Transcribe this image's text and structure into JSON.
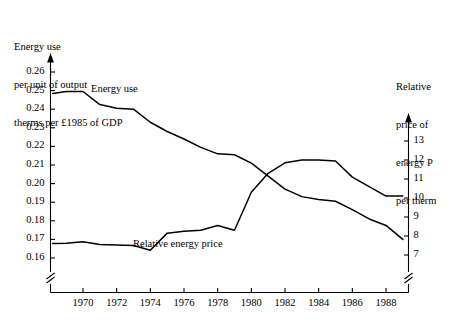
{
  "figure": {
    "left_caption_lines": [
      "Energy use",
      "per unit of output",
      "therms per £1985 of GDP"
    ],
    "right_caption_lines": [
      "Relative",
      "price of",
      "energy P",
      "per therm"
    ]
  },
  "chart_data": {
    "type": "line",
    "title": "",
    "xlabel": "",
    "ylabel": "Energy use per unit of output therms per £1985 of GDP",
    "y2label": "Relative price of energy P per therm",
    "grid": false,
    "legend": "inline-labels",
    "xlim": [
      1968.2,
      1989.2
    ],
    "xticks": [
      1970,
      1972,
      1974,
      1976,
      1978,
      1980,
      1982,
      1984,
      1986,
      1988
    ],
    "xticklabels": [
      "1970",
      "1972",
      "1974",
      "1976",
      "1978",
      "1980",
      "1982",
      "1984",
      "1986",
      "1988"
    ],
    "ylim": [
      0.155,
      0.265
    ],
    "yticks": [
      0.16,
      0.17,
      0.18,
      0.19,
      0.2,
      0.21,
      0.22,
      0.23,
      0.24,
      0.25,
      0.26
    ],
    "yticklabels": [
      "0.16",
      "0.17",
      "0.18",
      "0.19",
      "0.20",
      "0.21",
      "0.22",
      "0.23",
      "0.24",
      "0.25",
      "0.26"
    ],
    "y2lim": [
      6.6,
      13.6
    ],
    "y2ticks": [
      7,
      8,
      9,
      10,
      11,
      12,
      13
    ],
    "y2ticklabels": [
      "7",
      "8",
      "9",
      "10",
      "11",
      "12",
      "13"
    ],
    "axis_break_left": true,
    "axis_break_right": true,
    "series": [
      {
        "name": "Energy use",
        "axis": "left",
        "label_text": "Energy use",
        "x": [
          1968.2,
          1969,
          1970,
          1971,
          1972,
          1973,
          1974,
          1975,
          1976,
          1977,
          1978,
          1979,
          1980,
          1981,
          1982,
          1983,
          1984,
          1985,
          1986,
          1987,
          1988,
          1989
        ],
        "y": [
          0.2485,
          0.2495,
          0.2495,
          0.2425,
          0.2405,
          0.24,
          0.233,
          0.228,
          0.224,
          0.2195,
          0.216,
          0.2155,
          0.211,
          0.204,
          0.197,
          0.193,
          0.1915,
          0.1905,
          0.186,
          0.181,
          0.1775,
          0.17
        ]
      },
      {
        "name": "Relative energy price",
        "axis": "right",
        "label_text": "Relative energy price",
        "x": [
          1968.2,
          1969,
          1970,
          1971,
          1972,
          1973,
          1974,
          1975,
          1976,
          1977,
          1978,
          1979,
          1980,
          1981,
          1982,
          1983,
          1984,
          1985,
          1986,
          1987,
          1988,
          1989
        ],
        "y": [
          7.6,
          7.62,
          7.7,
          7.55,
          7.52,
          7.5,
          7.25,
          8.15,
          8.25,
          8.3,
          8.55,
          8.3,
          10.3,
          11.3,
          11.85,
          12.0,
          12.0,
          11.95,
          11.1,
          10.6,
          10.1,
          10.1
        ]
      }
    ]
  }
}
